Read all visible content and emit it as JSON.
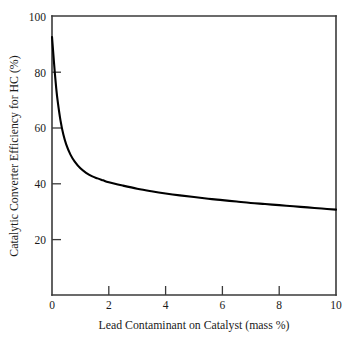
{
  "chart_data": {
    "type": "line",
    "title": "",
    "xlabel": "Lead Contaminant on Catalyst (mass %)",
    "ylabel": "Catalytic Converter Efficiency for HC (%)",
    "xlim": [
      0,
      10
    ],
    "ylim": [
      0,
      100
    ],
    "xticks": [
      0,
      2,
      4,
      6,
      8,
      10
    ],
    "yticks": [
      20,
      40,
      60,
      80,
      100
    ],
    "xtick_labels": [
      "0",
      "2",
      "4",
      "6",
      "8",
      "10"
    ],
    "ytick_labels": [
      "20",
      "40",
      "60",
      "80",
      "100"
    ],
    "grid": false,
    "legend": false,
    "legend_position": "none",
    "curve_color": "#000000",
    "axis_color": "#3a3a3a",
    "background_color": "#ffffff",
    "series": [
      {
        "name": "HC conversion efficiency",
        "x": [
          0.0,
          0.05,
          0.1,
          0.15,
          0.2,
          0.3,
          0.4,
          0.5,
          0.65,
          0.8,
          1.0,
          1.2,
          1.4,
          1.6,
          1.8,
          2.0,
          2.5,
          3.0,
          3.5,
          4.0,
          4.5,
          5.0,
          5.5,
          6.0,
          6.5,
          7.0,
          7.5,
          8.0,
          8.5,
          9.0,
          9.5,
          10.0
        ],
        "y": [
          92.5,
          86.0,
          79.5,
          74.0,
          69.5,
          62.5,
          57.5,
          54.0,
          50.3,
          47.8,
          45.4,
          43.8,
          42.6,
          41.8,
          41.1,
          40.4,
          39.2,
          38.1,
          37.2,
          36.4,
          35.7,
          35.1,
          34.5,
          34.0,
          33.5,
          33.0,
          32.6,
          32.2,
          31.8,
          31.4,
          31.0,
          30.6
        ]
      }
    ],
    "annotations": []
  },
  "labels": {
    "x_axis_title": "Lead Contaminant on Catalyst (mass %)",
    "y_axis_title": "Catalytic Converter Efficiency for HC (%)"
  }
}
